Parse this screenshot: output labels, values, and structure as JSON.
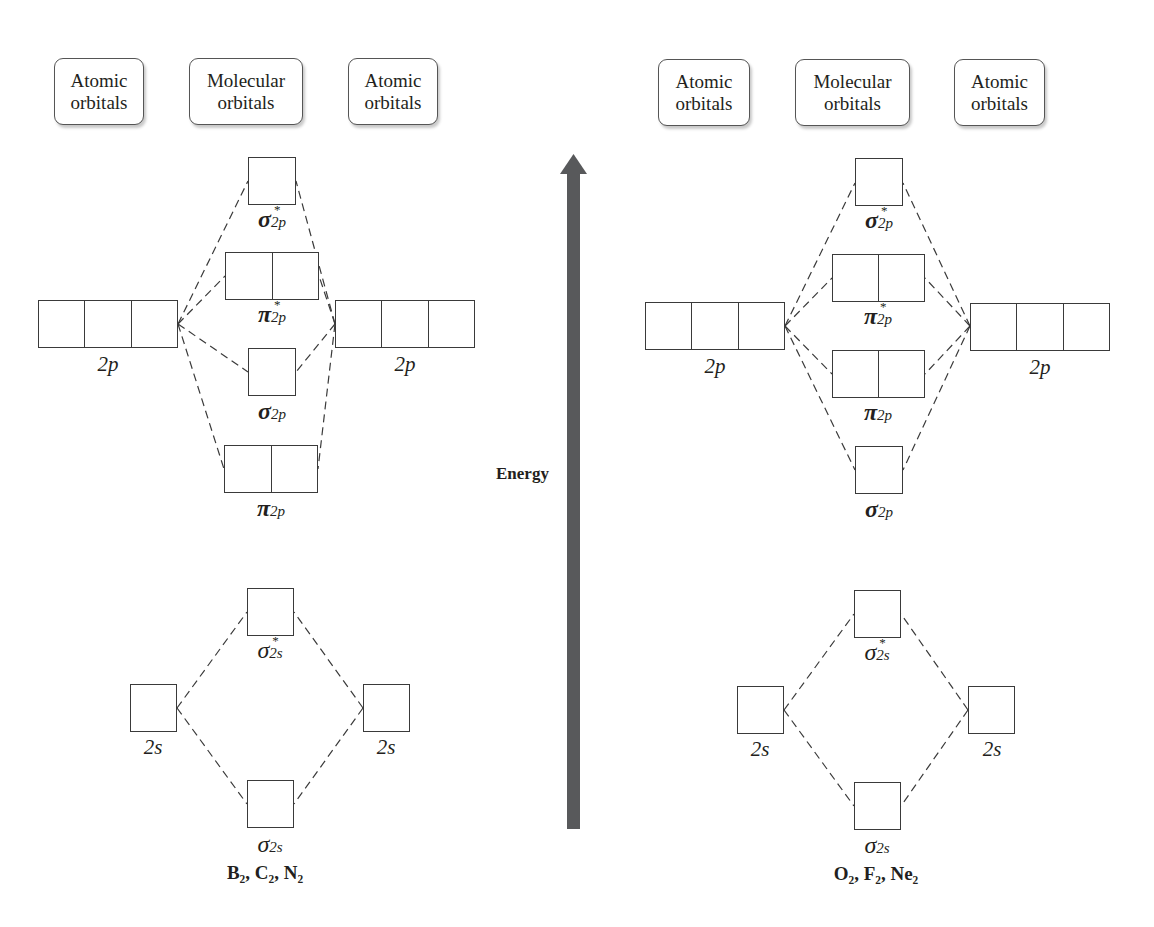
{
  "headers": {
    "atomic": "Atomic orbitals",
    "atomic_line1": "Atomic",
    "atomic_line2": "orbitals",
    "molecular_line1": "Molecular",
    "molecular_line2": "orbitals"
  },
  "energy_label": "Energy",
  "colors": {
    "arrow": "#58595b",
    "line": "#3a3a3a"
  },
  "left_panel": {
    "molecules": "B₂, C₂, N₂",
    "atomic_2p": "2p",
    "atomic_2s": "2s",
    "mo_order_top_to_bottom": [
      "σ*2p",
      "π*2p",
      "σ2p",
      "π2p",
      "σ*2s",
      "σ2s"
    ],
    "labels": {
      "sigma_star_2p": {
        "g": "σ",
        "sub": "2p",
        "star": "*"
      },
      "pi_star_2p": {
        "g": "π",
        "sub": "2p",
        "star": "*"
      },
      "sigma_2p": {
        "g": "σ",
        "sub": "2p"
      },
      "pi_2p": {
        "g": "π",
        "sub": "2p"
      },
      "sigma_star_2s": {
        "g": "σ",
        "sub": "2s",
        "star": "*"
      },
      "sigma_2s": {
        "g": "σ",
        "sub": "2s"
      }
    }
  },
  "right_panel": {
    "molecules": "O₂, F₂, Ne₂",
    "atomic_2p": "2p",
    "atomic_2s": "2s",
    "mo_order_top_to_bottom": [
      "σ*2p",
      "π*2p",
      "π2p",
      "σ2p",
      "σ*2s",
      "σ2s"
    ],
    "labels": {
      "sigma_star_2p": {
        "g": "σ",
        "sub": "2p",
        "star": "*"
      },
      "pi_star_2p": {
        "g": "π",
        "sub": "2p",
        "star": "*"
      },
      "pi_2p": {
        "g": "π",
        "sub": "2p"
      },
      "sigma_2p": {
        "g": "σ",
        "sub": "2p"
      },
      "sigma_star_2s": {
        "g": "σ",
        "sub": "2s",
        "star": "*"
      },
      "sigma_2s": {
        "g": "σ",
        "sub": "2s"
      }
    }
  }
}
